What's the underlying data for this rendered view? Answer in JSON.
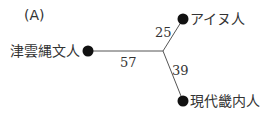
{
  "panel_label": "(A)",
  "tree": {
    "junction": {
      "x": 163,
      "y": 51
    },
    "nodes": [
      {
        "id": "jomon",
        "label": "津雲縄文人",
        "x": 88,
        "y": 51,
        "branch_length": "57"
      },
      {
        "id": "ainu",
        "label": "アイヌ人",
        "x": 183,
        "y": 19,
        "branch_length": "25"
      },
      {
        "id": "kinai",
        "label": "現代畿内人",
        "x": 183,
        "y": 101,
        "branch_length": "39"
      }
    ]
  },
  "colors": {
    "line": "#555555",
    "dot": "#111111",
    "text": "#333333"
  }
}
